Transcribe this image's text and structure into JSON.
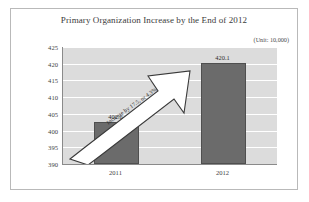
{
  "chart_data": {
    "type": "bar",
    "title": "Primary Organization Increase by the End of 2012",
    "unit_note": "(Unit: 10,000)",
    "categories": [
      "2011",
      "2012"
    ],
    "values": [
      402.6,
      420.1
    ],
    "value_labels": [
      "402.6",
      "420.1"
    ],
    "xlabel": "",
    "ylabel": "",
    "ylim": [
      390,
      425
    ],
    "ytick_labels": [
      "425",
      "420",
      "415",
      "410",
      "405",
      "400",
      "395",
      "390"
    ],
    "ytick_values": [
      425,
      420,
      415,
      410,
      405,
      400,
      395,
      390
    ],
    "grid": true,
    "legend": false,
    "annotations": [
      {
        "text": "Increase by 17.5, or 4.3%",
        "kind": "arrow-callout",
        "from_category": "2011",
        "to_category": "2012"
      }
    ],
    "colors": {
      "bar": "#6b6b6b",
      "bar_outline": "#4f4f4f",
      "plot_background": "#dcdcdc",
      "gridline": "#ffffff",
      "axis": "#8a8a8a",
      "frame": "#b9b9b9",
      "arrow_fill": "#ffffff",
      "arrow_outline": "#3a3a3a",
      "text": "#3b3b3b"
    }
  }
}
